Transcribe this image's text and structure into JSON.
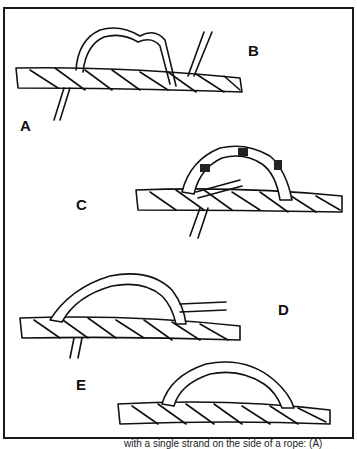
{
  "figure": {
    "labels": {
      "a": "A",
      "b": "B",
      "c": "C",
      "d": "D",
      "e": "E"
    },
    "caption_fragment": "with a single strand on the side of a rope: (A)",
    "panels": [
      {
        "id": "A",
        "description": "single strand end tucked under rope"
      },
      {
        "id": "B",
        "description": "wavy strand looped over rope, end rising"
      },
      {
        "id": "C",
        "description": "strand twisted back along itself forming a bight over rope"
      },
      {
        "id": "D",
        "description": "completed twisted loop over rope with loose end"
      },
      {
        "id": "E",
        "description": "finished eye on side of rope"
      }
    ],
    "colors": {
      "ink": "#111111",
      "paper": "#ffffff"
    }
  }
}
